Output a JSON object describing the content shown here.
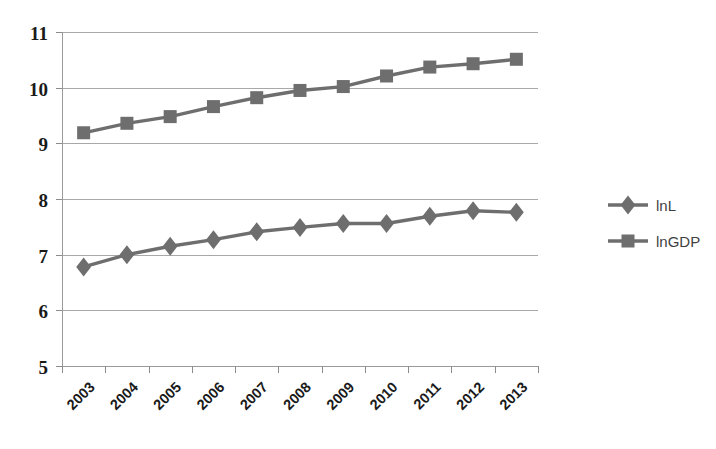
{
  "chart_data": {
    "type": "line",
    "title": "",
    "subtitle": "",
    "xlabel": "",
    "ylabel": "",
    "categories": [
      "2003",
      "2004",
      "2005",
      "2006",
      "2007",
      "2008",
      "2009",
      "2010",
      "2011",
      "2012",
      "2013"
    ],
    "ylim": [
      5,
      11
    ],
    "ytick_labels": [
      "11",
      "10",
      "9",
      "8",
      "7",
      "6",
      "5"
    ],
    "ytick_values": [
      11,
      10,
      9,
      8,
      7,
      6,
      5
    ],
    "grid": true,
    "legend_position": "right",
    "series": [
      {
        "name": "lnL",
        "marker": "diamond",
        "color": "#6e6e6e",
        "values": [
          6.78,
          7.0,
          7.15,
          7.27,
          7.41,
          7.49,
          7.56,
          7.56,
          7.69,
          7.79,
          7.76
        ]
      },
      {
        "name": "lnGDP",
        "marker": "square",
        "color": "#6e6e6e",
        "values": [
          9.19,
          9.36,
          9.48,
          9.66,
          9.82,
          9.95,
          10.02,
          10.21,
          10.37,
          10.43,
          10.51
        ]
      }
    ]
  },
  "legend": {
    "entries": [
      {
        "label": "lnL",
        "marker": "diamond",
        "color": "#6e6e6e"
      },
      {
        "label": "lnGDP",
        "marker": "square",
        "color": "#6e6e6e"
      }
    ]
  },
  "axes": {
    "x_rotation_degrees": -45,
    "plot_background": "#ffffff"
  }
}
